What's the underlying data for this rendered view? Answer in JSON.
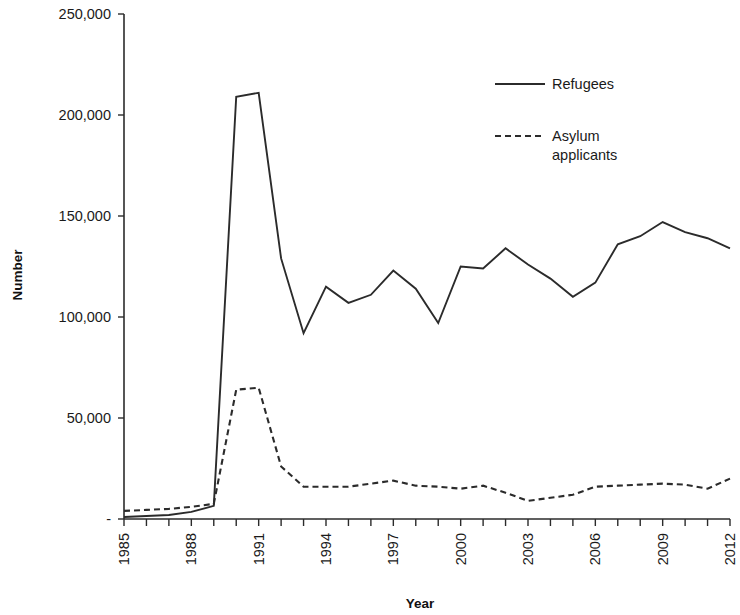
{
  "chart_data": {
    "type": "line",
    "title": "",
    "xlabel": "Year",
    "ylabel": "Number",
    "xlim": [
      1985,
      2012
    ],
    "ylim": [
      0,
      250000
    ],
    "grid": false,
    "legend_position": "top-right",
    "ytick_labels": [
      "250,000",
      "200,000",
      "150,000",
      "100,000",
      "50,000",
      "-"
    ],
    "ytick_values": [
      250000,
      200000,
      150000,
      100000,
      50000,
      0
    ],
    "xtick_labels": [
      "1985",
      "1988",
      "1991",
      "1994",
      "1997",
      "2000",
      "2003",
      "2006",
      "2009",
      "2012"
    ],
    "xtick_values": [
      1985,
      1988,
      1991,
      1994,
      1997,
      2000,
      2003,
      2006,
      2009,
      2012
    ],
    "x": [
      1985,
      1986,
      1987,
      1988,
      1989,
      1990,
      1991,
      1992,
      1993,
      1994,
      1995,
      1996,
      1997,
      1998,
      1999,
      2000,
      2001,
      2002,
      2003,
      2004,
      2005,
      2006,
      2007,
      2008,
      2009,
      2010,
      2011,
      2012
    ],
    "series": [
      {
        "name": "Refugees",
        "style": "solid",
        "color": "#2b2b2b",
        "values": [
          1000,
          1500,
          2000,
          3500,
          6500,
          209000,
          211000,
          129000,
          92000,
          115000,
          107000,
          111000,
          123000,
          114000,
          97000,
          125000,
          124000,
          134000,
          126000,
          119000,
          110000,
          117000,
          136000,
          140000,
          147000,
          142000,
          139000,
          134000
        ]
      },
      {
        "name": "Asylum applicants",
        "style": "dashed",
        "color": "#2b2b2b",
        "values": [
          4000,
          4500,
          5000,
          6000,
          7500,
          64000,
          65000,
          26000,
          16000,
          16000,
          16000,
          17500,
          19000,
          16500,
          16000,
          15000,
          16500,
          13000,
          9000,
          10500,
          12000,
          16000,
          16500,
          17000,
          17500,
          17000,
          15000,
          20000
        ]
      }
    ],
    "legend": [
      {
        "label": "Refugees",
        "style": "solid"
      },
      {
        "label": "Asylum",
        "label2": "applicants",
        "style": "dashed"
      }
    ]
  }
}
